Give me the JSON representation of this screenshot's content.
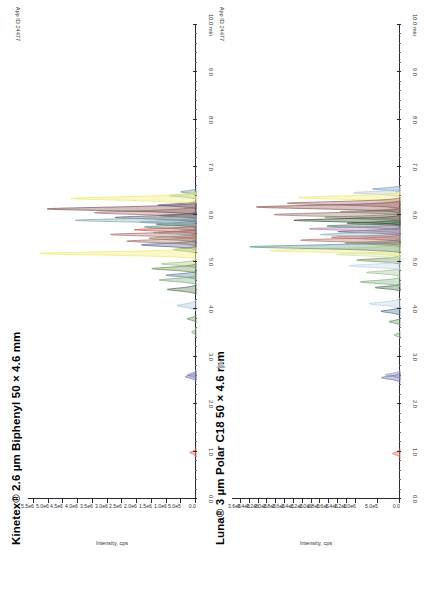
{
  "document": {
    "type": "chromatogram-comparison-figure",
    "background": "#ffffff",
    "orientation_note": "rotated"
  },
  "panels": [
    {
      "id": "kinetex",
      "title": "Kinetex® 2.6 µm Biphenyl 50 × 4.6 mm",
      "app_id": "App ID 24477"
    },
    {
      "id": "luna",
      "title": "Luna® 3 µm Polar C18 50 × 4.6 mm",
      "app_id": "App ID 24477"
    }
  ],
  "chart_data": [
    {
      "type": "line",
      "id": "kinetex",
      "title": "Kinetex® 2.6 µm Biphenyl 50 × 4.6 mm",
      "annotation": "App ID 24477",
      "xlabel": "min",
      "ylabel": "Intensity, cps",
      "xlim": [
        0.0,
        10.0
      ],
      "ylim": [
        0.0,
        5700000
      ],
      "grid": false,
      "legend": "none",
      "x_ticks": [
        0.0,
        1.0,
        2.0,
        3.0,
        4.0,
        5.0,
        6.0,
        7.0,
        8.0,
        9.0,
        10.0
      ],
      "x_tick_labels": [
        "0.0",
        "1.0",
        "2.0",
        "3.0",
        "4.0",
        "5.0",
        "6.0",
        "7.0",
        "8.0",
        "9.0",
        "10.0 min"
      ],
      "y_ticks": [
        0,
        500000,
        1000000,
        1500000,
        2000000,
        2500000,
        3000000,
        3500000,
        4000000,
        4500000,
        5000000,
        5500000
      ],
      "y_tick_labels": [
        "0.0",
        "5.0e5",
        "1.0e6",
        "1.5e6",
        "2.0e6",
        "2.5e6",
        "3.0e6",
        "3.5e6",
        "4.0e6",
        "4.5e6",
        "5.0e6",
        "5.5e6"
      ],
      "series": [
        {
          "name": "peak-01",
          "color": "#d4695f",
          "x": 0.98,
          "height": 210000,
          "width": 0.045
        },
        {
          "name": "peak-02",
          "color": "#6e6fae",
          "x": 2.58,
          "height": 360000,
          "width": 0.05
        },
        {
          "name": "peak-03",
          "color": "#8f8fbe",
          "x": 2.62,
          "height": 300000,
          "width": 0.05
        },
        {
          "name": "peak-04",
          "color": "#7da77d",
          "x": 3.52,
          "height": 150000,
          "width": 0.04
        },
        {
          "name": "peak-05",
          "color": "#5f8f5f",
          "x": 3.8,
          "height": 300000,
          "width": 0.04
        },
        {
          "name": "peak-06",
          "color": "#a8c2d8",
          "x": 4.08,
          "height": 640000,
          "width": 0.055
        },
        {
          "name": "peak-07",
          "color": "#4f6f4f",
          "x": 4.42,
          "height": 980000,
          "width": 0.05
        },
        {
          "name": "peak-08",
          "color": "#7ea87e",
          "x": 4.62,
          "height": 1250000,
          "width": 0.05
        },
        {
          "name": "peak-09",
          "color": "#5a7f99",
          "x": 4.72,
          "height": 1020000,
          "width": 0.045
        },
        {
          "name": "peak-10",
          "color": "#6b8f4f",
          "x": 4.86,
          "height": 1500000,
          "width": 0.05
        },
        {
          "name": "peak-11",
          "color": "#9fbf7f",
          "x": 4.96,
          "height": 1180000,
          "width": 0.045
        },
        {
          "name": "peak-12",
          "color": "#eaea6a",
          "x": 5.18,
          "height": 5300000,
          "width": 0.055
        },
        {
          "name": "peak-13",
          "color": "#7f9f6f",
          "x": 5.26,
          "height": 760000,
          "width": 0.04
        },
        {
          "name": "peak-14",
          "color": "#4a6a8a",
          "x": 5.36,
          "height": 1850000,
          "width": 0.05
        },
        {
          "name": "peak-15",
          "color": "#a36b6b",
          "x": 5.44,
          "height": 2350000,
          "width": 0.05
        },
        {
          "name": "peak-16",
          "color": "#8a8a5a",
          "x": 5.5,
          "height": 1600000,
          "width": 0.045
        },
        {
          "name": "peak-17",
          "color": "#b06a6a",
          "x": 5.58,
          "height": 2900000,
          "width": 0.05
        },
        {
          "name": "peak-18",
          "color": "#6f9f9f",
          "x": 5.62,
          "height": 1450000,
          "width": 0.04
        },
        {
          "name": "peak-19",
          "color": "#c05a4a",
          "x": 5.68,
          "height": 2100000,
          "width": 0.045
        },
        {
          "name": "peak-20",
          "color": "#5f8f8f",
          "x": 5.74,
          "height": 1750000,
          "width": 0.045
        },
        {
          "name": "peak-21",
          "color": "#3f5f3f",
          "x": 5.8,
          "height": 1350000,
          "width": 0.04
        },
        {
          "name": "peak-22",
          "color": "#84a4c4",
          "x": 5.84,
          "height": 1900000,
          "width": 0.045
        },
        {
          "name": "peak-23",
          "color": "#7fa8a8",
          "x": 5.88,
          "height": 4100000,
          "width": 0.055
        },
        {
          "name": "peak-24",
          "color": "#6a5a7a",
          "x": 5.94,
          "height": 2750000,
          "width": 0.05
        },
        {
          "name": "peak-25",
          "color": "#2f4f3f",
          "x": 5.98,
          "height": 1250000,
          "width": 0.035
        },
        {
          "name": "peak-26",
          "color": "#9b6f6f",
          "x": 6.04,
          "height": 3450000,
          "width": 0.06
        },
        {
          "name": "peak-27",
          "color": "#7a4f4f",
          "x": 6.12,
          "height": 5050000,
          "width": 0.06
        },
        {
          "name": "peak-28",
          "color": "#5a5a8a",
          "x": 6.2,
          "height": 1300000,
          "width": 0.04
        },
        {
          "name": "peak-29",
          "color": "#eaea6a",
          "x": 6.34,
          "height": 4250000,
          "width": 0.06
        },
        {
          "name": "peak-30",
          "color": "#8fb89f",
          "x": 6.4,
          "height": 900000,
          "width": 0.04
        },
        {
          "name": "peak-31",
          "color": "#6f8f9f",
          "x": 6.48,
          "height": 520000,
          "width": 0.035
        }
      ]
    },
    {
      "type": "line",
      "id": "luna",
      "title": "Luna® 3 µm Polar C18 50 × 4.6 mm",
      "annotation": "App ID 24477",
      "xlabel": "min",
      "ylabel": "Intensity, cps",
      "xlim": [
        0.0,
        10.0
      ],
      "ylim": [
        0.0,
        3800000
      ],
      "grid": false,
      "legend": "none",
      "x_ticks": [
        0.0,
        1.0,
        2.0,
        3.0,
        4.0,
        5.0,
        6.0,
        7.0,
        8.0,
        9.0,
        10.0
      ],
      "x_tick_labels": [
        "0.0",
        "1.0",
        "2.0",
        "3.0",
        "4.0",
        "5.0",
        "6.0",
        "7.0",
        "8.0",
        "9.0",
        "10.0 min"
      ],
      "y_ticks": [
        0,
        500000,
        1000000,
        1200000,
        1400000,
        1600000,
        1800000,
        2000000,
        2200000,
        2400000,
        2600000,
        2800000,
        3000000,
        3200000,
        3400000,
        3600000
      ],
      "y_tick_labels": [
        "0.0",
        "5.0e5",
        "1.0e6",
        "1.2e6",
        "1.4e6",
        "1.6e6",
        "1.8e6",
        "2.0e6",
        "2.2e6",
        "2.4e6",
        "2.6e6",
        "2.8e6",
        "3.0e6",
        "3.2e6",
        "3.4e6",
        "3.6e6"
      ],
      "series": [
        {
          "name": "peak-01",
          "color": "#d4695f",
          "x": 0.96,
          "height": 170000,
          "width": 0.045
        },
        {
          "name": "peak-02",
          "color": "#6e6fae",
          "x": 2.56,
          "height": 420000,
          "width": 0.05
        },
        {
          "name": "peak-03",
          "color": "#9090c0",
          "x": 2.62,
          "height": 330000,
          "width": 0.045
        },
        {
          "name": "peak-04",
          "color": "#7da77d",
          "x": 3.46,
          "height": 140000,
          "width": 0.035
        },
        {
          "name": "peak-05",
          "color": "#5f8f5f",
          "x": 3.74,
          "height": 250000,
          "width": 0.04
        },
        {
          "name": "peak-06",
          "color": "#4f6f8f",
          "x": 3.96,
          "height": 430000,
          "width": 0.045
        },
        {
          "name": "peak-07",
          "color": "#b8cede",
          "x": 4.12,
          "height": 700000,
          "width": 0.055
        },
        {
          "name": "peak-08",
          "color": "#4a6a4a",
          "x": 4.46,
          "height": 560000,
          "width": 0.04
        },
        {
          "name": "peak-09",
          "color": "#7fae7f",
          "x": 4.58,
          "height": 900000,
          "width": 0.05
        },
        {
          "name": "peak-10",
          "color": "#9fbf8f",
          "x": 4.78,
          "height": 760000,
          "width": 0.045
        },
        {
          "name": "peak-11",
          "color": "#b9d3e3",
          "x": 4.92,
          "height": 1150000,
          "width": 0.05
        },
        {
          "name": "peak-12",
          "color": "#6b8f4f",
          "x": 5.04,
          "height": 980000,
          "width": 0.045
        },
        {
          "name": "peak-13",
          "color": "#cfe0b0",
          "x": 5.16,
          "height": 1450000,
          "width": 0.05
        },
        {
          "name": "peak-14",
          "color": "#eaea6a",
          "x": 5.24,
          "height": 2950000,
          "width": 0.06
        },
        {
          "name": "peak-15",
          "color": "#5f8f8f",
          "x": 5.32,
          "height": 3400000,
          "width": 0.06
        },
        {
          "name": "peak-16",
          "color": "#8a8a5a",
          "x": 5.4,
          "height": 1250000,
          "width": 0.04
        },
        {
          "name": "peak-17",
          "color": "#b07070",
          "x": 5.46,
          "height": 2250000,
          "width": 0.055
        },
        {
          "name": "peak-18",
          "color": "#c05a4a",
          "x": 5.52,
          "height": 1550000,
          "width": 0.045
        },
        {
          "name": "peak-19",
          "color": "#8fb0c8",
          "x": 5.58,
          "height": 1800000,
          "width": 0.05
        },
        {
          "name": "peak-20",
          "color": "#6a5a7a",
          "x": 5.64,
          "height": 1400000,
          "width": 0.04
        },
        {
          "name": "peak-21",
          "color": "#a87fa8",
          "x": 5.7,
          "height": 2050000,
          "width": 0.05
        },
        {
          "name": "peak-22",
          "color": "#4f7f6f",
          "x": 5.76,
          "height": 1650000,
          "width": 0.045
        },
        {
          "name": "peak-23",
          "color": "#3f5f3f",
          "x": 5.82,
          "height": 1200000,
          "width": 0.035
        },
        {
          "name": "peak-24",
          "color": "#2f4f2f",
          "x": 5.88,
          "height": 2400000,
          "width": 0.05
        },
        {
          "name": "peak-25",
          "color": "#7a9a6a",
          "x": 5.94,
          "height": 1700000,
          "width": 0.045
        },
        {
          "name": "peak-26",
          "color": "#9b6f6f",
          "x": 6.0,
          "height": 2850000,
          "width": 0.06
        },
        {
          "name": "peak-27",
          "color": "#6f8f6f",
          "x": 6.06,
          "height": 1350000,
          "width": 0.04
        },
        {
          "name": "peak-28",
          "color": "#8a4f4f",
          "x": 6.16,
          "height": 3250000,
          "width": 0.06
        },
        {
          "name": "peak-29",
          "color": "#a06060",
          "x": 6.24,
          "height": 2550000,
          "width": 0.055
        },
        {
          "name": "peak-30",
          "color": "#eaea6a",
          "x": 6.36,
          "height": 2300000,
          "width": 0.055
        },
        {
          "name": "peak-31",
          "color": "#b0c8d8",
          "x": 6.46,
          "height": 1050000,
          "width": 0.045
        },
        {
          "name": "peak-32",
          "color": "#7f9fbf",
          "x": 6.54,
          "height": 620000,
          "width": 0.035
        }
      ]
    }
  ]
}
